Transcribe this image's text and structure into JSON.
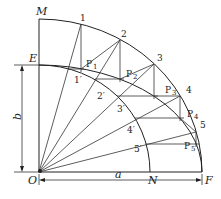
{
  "diagram": {
    "labels": {
      "M": "M",
      "E": "E",
      "O": "O",
      "N": "N",
      "F": "F",
      "a": "a",
      "b": "b"
    },
    "outer_points": [
      "1",
      "2",
      "3",
      "4",
      "5"
    ],
    "inner_points": [
      "1′",
      "2′",
      "3′",
      "4′",
      "5′"
    ],
    "ellipse_points": [
      {
        "base": "P",
        "sub": "1"
      },
      {
        "base": "P",
        "sub": "2"
      },
      {
        "base": "P",
        "sub": "3"
      },
      {
        "base": "P",
        "sub": "4"
      },
      {
        "base": "P",
        "sub": "5"
      }
    ],
    "dimensions": {
      "major_semi_axis": "a",
      "minor_semi_axis": "b"
    }
  }
}
